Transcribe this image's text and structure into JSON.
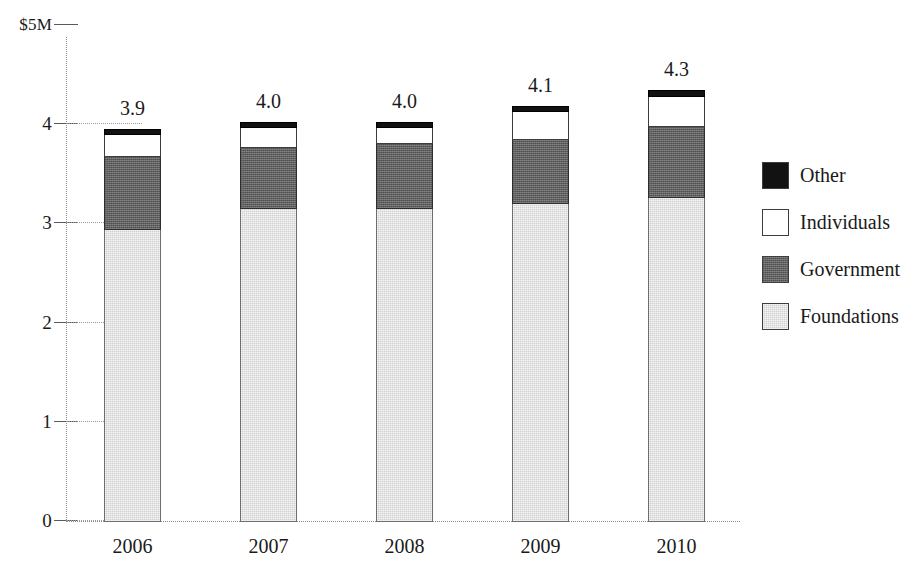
{
  "chart_data": {
    "type": "bar",
    "subtype": "stacked-bar",
    "title": "",
    "xlabel": "",
    "ylabel": "$5M",
    "y_axis_top_label": "$5M",
    "categories": [
      "2006",
      "2007",
      "2008",
      "2009",
      "2010"
    ],
    "series": [
      {
        "name": "Foundations",
        "color": "#cfcfcf",
        "values": [
          2.94,
          3.15,
          3.15,
          3.2,
          3.26
        ]
      },
      {
        "name": "Government",
        "color": "#616161",
        "values": [
          0.74,
          0.62,
          0.66,
          0.65,
          0.72
        ]
      },
      {
        "name": "Individuals",
        "color": "#ffffff",
        "values": [
          0.22,
          0.2,
          0.16,
          0.28,
          0.3
        ]
      },
      {
        "name": "Other",
        "color": "#121212",
        "values": [
          0.05,
          0.05,
          0.05,
          0.05,
          0.06
        ]
      }
    ],
    "totals": [
      3.9,
      4.0,
      4.0,
      4.1,
      4.3
    ],
    "bar_labels": [
      "3.9",
      "4.0",
      "4.0",
      "4.1",
      "4.3"
    ],
    "ylim": [
      0,
      5
    ],
    "yticks": [
      0,
      1,
      2,
      3,
      4,
      5
    ],
    "ytick_labels": [
      "0",
      "1",
      "2",
      "3",
      "4",
      "$5M"
    ],
    "grid": true,
    "grid_style": "dotted-horizontal",
    "legend_position": "right",
    "legend_order": [
      "Other",
      "Individuals",
      "Government",
      "Foundations"
    ],
    "units": "millions of dollars"
  },
  "axis": {
    "ticks": [
      {
        "value": 5,
        "label": "$5M",
        "is_top": true
      },
      {
        "value": 4,
        "label": "4",
        "is_top": false
      },
      {
        "value": 3,
        "label": "3",
        "is_top": false
      },
      {
        "value": 2,
        "label": "2",
        "is_top": false
      },
      {
        "value": 1,
        "label": "1",
        "is_top": false
      },
      {
        "value": 0,
        "label": "0",
        "is_top": false
      }
    ]
  },
  "legend": {
    "items": [
      {
        "label": "Other",
        "swatch": "black"
      },
      {
        "label": "Individuals",
        "swatch": "white"
      },
      {
        "label": "Government",
        "swatch": "dark-gray"
      },
      {
        "label": "Foundations",
        "swatch": "light-gray"
      }
    ]
  }
}
